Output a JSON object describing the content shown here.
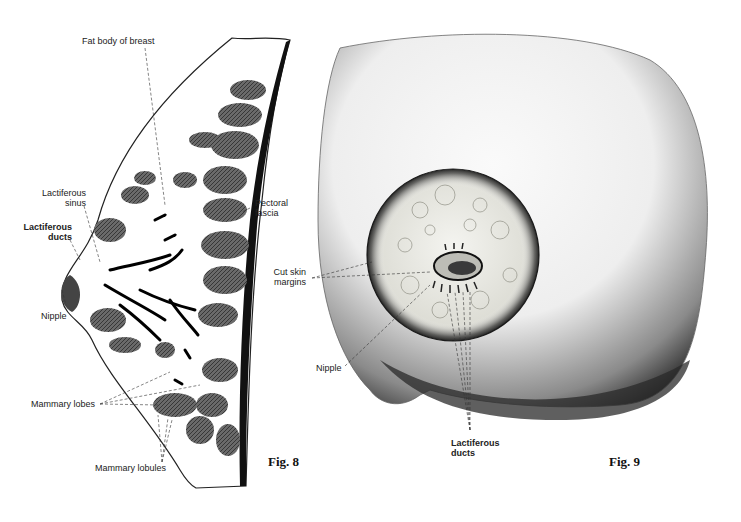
{
  "figure8": {
    "caption": "Fig. 8",
    "labels": {
      "fat_body": "Fat body of breast",
      "lactiferous_sinus_1": "Lactiferous",
      "lactiferous_sinus_2": "sinus",
      "lactiferous_ducts_1": "Lactiferous",
      "lactiferous_ducts_2": "ducts",
      "nipple": "Nipple",
      "pectoral_fascia_1": "Pectoral",
      "pectoral_fascia_2": "fascia",
      "mammary_lobes": "Mammary lobes",
      "mammary_lobules": "Mammary lobules"
    }
  },
  "figure9": {
    "caption": "Fig. 9",
    "labels": {
      "cut_skin_1": "Cut skin",
      "cut_skin_2": "margins",
      "nipple": "Nipple",
      "lactiferous_ducts_1": "Lactiferous",
      "lactiferous_ducts_2": "ducts"
    }
  },
  "colors": {
    "background": "#ffffff",
    "ink": "#1a1a1a",
    "lobe": "#5a5a5a",
    "skin_light": "#f2f2f2",
    "skin_shadow": "#3a3a3a"
  }
}
